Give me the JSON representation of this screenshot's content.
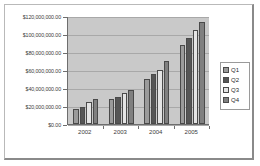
{
  "chart_data": {
    "type": "bar",
    "title": "",
    "subtitle": "",
    "xlabel": "",
    "ylabel": "",
    "categories": [
      "2002",
      "2003",
      "2004",
      "2005"
    ],
    "series": [
      {
        "name": "Q1",
        "color": "#9b9b9b",
        "values": [
          17000000,
          28000000,
          50000000,
          88000000
        ]
      },
      {
        "name": "Q2",
        "color": "#565656",
        "values": [
          19000000,
          30000000,
          56000000,
          96000000
        ]
      },
      {
        "name": "Q3",
        "color": "#e4e4e4",
        "values": [
          25000000,
          34000000,
          60000000,
          104000000
        ]
      },
      {
        "name": "Q4",
        "color": "#808080",
        "values": [
          28000000,
          38000000,
          70000000,
          113000000
        ]
      }
    ],
    "ylim": [
      0,
      120000000
    ],
    "yticks": [
      0,
      20000000,
      40000000,
      60000000,
      80000000,
      100000000,
      120000000
    ],
    "ytick_labels": [
      "$0.00",
      "$20,000,000.00",
      "$40,000,000.00",
      "$60,000,000.00",
      "$80,000,000.00",
      "$100,000,000.00",
      "$120,000,000.00"
    ],
    "grid": true,
    "grid_axis": "y",
    "legend": {
      "position": "right",
      "entries": [
        "Q1",
        "Q2",
        "Q3",
        "Q4"
      ]
    },
    "plot_background": "#c9c9c9",
    "frame_background": "#ffffff"
  }
}
